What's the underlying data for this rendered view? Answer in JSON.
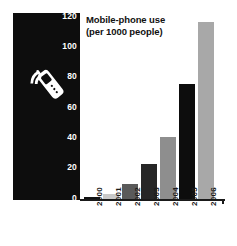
{
  "chart_data": {
    "type": "bar",
    "title": "Mobile-phone use (per 1000 people)",
    "title_lines": [
      "Mobile-phone use",
      "(per 1000 people)"
    ],
    "xlabel": "",
    "ylabel": "",
    "categories": [
      "2000",
      "2001",
      "2002",
      "2003",
      "2004",
      "2005",
      "2006"
    ],
    "values": [
      2,
      4,
      11,
      25,
      44,
      81,
      124
    ],
    "ylim": [
      0,
      130
    ],
    "yticks": [
      0,
      20,
      40,
      60,
      80,
      100,
      120
    ],
    "ytick_labels": [
      "0",
      "20",
      "40",
      "60",
      "80",
      "100",
      "120"
    ],
    "grid": false,
    "legend": "none",
    "bar_colors": [
      "#111111",
      "#c9c9c9",
      "#5a5a5a",
      "#262626",
      "#8e8e8e",
      "#0d0d0d",
      "#a8a8a8"
    ]
  },
  "panel": {
    "background_color": "#0d0d0d",
    "icon_name": "mobile-phone-icon",
    "icon_color": "#ffffff"
  },
  "axis": {
    "baseline_color": "#1a1a1a"
  }
}
